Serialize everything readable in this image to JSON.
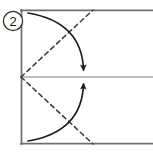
{
  "diagram": {
    "type": "origami-fold-step",
    "step_label": "2",
    "step_badge_shape": "circle",
    "caption": "",
    "colors": {
      "paper_edge": "#6e6e6e",
      "crease_center_line": "#a8a8a8",
      "fold_line_dashed": "#3a3a3a",
      "arrow": "#1a1a1a",
      "badge_outline": "#2a2a2a",
      "background": "#ffffff"
    },
    "paper": {
      "name": "paper-sheet",
      "left": 21,
      "top": 10,
      "right": 153,
      "bottom": 144,
      "right_edge_cropped": true,
      "edge_width": 1.6
    },
    "center_crease": {
      "name": "center-horizontal-crease",
      "style": "solid-gray",
      "x1": 21,
      "y1": 77,
      "x2": 153,
      "y2": 77,
      "label": "existing center crease"
    },
    "fold_lines": [
      {
        "name": "upper-diagonal-fold-line",
        "style": "dashed",
        "x1": 21,
        "y1": 77,
        "x2": 93,
        "y2": 10,
        "label": "valley fold (upper)"
      },
      {
        "name": "lower-diagonal-fold-line",
        "style": "dashed",
        "x1": 21,
        "y1": 77,
        "x2": 93,
        "y2": 144,
        "label": "valley fold (lower)"
      }
    ],
    "arrows": [
      {
        "name": "upper-fold-arrow",
        "direction": "down",
        "start_x": 28,
        "start_y": 13,
        "end_x": 84,
        "end_y": 73,
        "curve_cx": 82,
        "curve_cy": 22,
        "label": "fold top-left corner down to center"
      },
      {
        "name": "lower-fold-arrow",
        "direction": "up",
        "start_x": 28,
        "start_y": 141,
        "end_x": 84,
        "end_y": 81,
        "curve_cx": 82,
        "curve_cy": 132,
        "label": "fold bottom-left corner up to center"
      }
    ]
  }
}
